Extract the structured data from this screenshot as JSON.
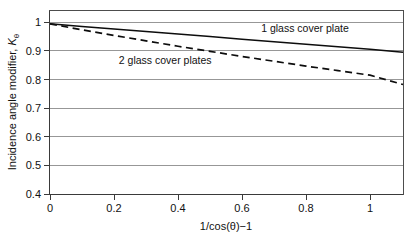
{
  "chart_data": {
    "type": "line",
    "title": "",
    "xlabel": "1/cos(θ)−1",
    "ylabel_prefix": "Incidence angle modifier, ",
    "ylabel_symbol": "K",
    "ylabel_subscript": "θ",
    "xlim": [
      0,
      1.103
    ],
    "ylim": [
      0.4,
      1.047
    ],
    "xticks": [
      0,
      0.2,
      0.4,
      0.6,
      0.8,
      1
    ],
    "xticklabels": [
      "0",
      "0.2",
      "0.4",
      "0.6",
      "0.8",
      "1"
    ],
    "yticks": [
      0.4,
      0.5,
      0.6,
      0.7,
      0.8,
      0.9,
      1
    ],
    "yticklabels": [
      "0.4",
      "0.5",
      "0.6",
      "0.7",
      "0.8",
      "0.9",
      "1"
    ],
    "grid": "horizontal",
    "legend_position": "inline-annotations",
    "series": [
      {
        "name": "1 glass cover plate",
        "style": "solid",
        "color": "#0d0d0d",
        "x": [
          0,
          0.1,
          0.2,
          0.3,
          0.4,
          0.5,
          0.6,
          0.7,
          0.8,
          0.9,
          1.0,
          1.103
        ],
        "values": [
          1.0,
          0.991,
          0.982,
          0.973,
          0.964,
          0.955,
          0.946,
          0.937,
          0.928,
          0.919,
          0.91,
          0.9
        ]
      },
      {
        "name": "2 glass cover plates",
        "style": "dashed",
        "color": "#0d0d0d",
        "x": [
          0,
          0.1,
          0.2,
          0.3,
          0.4,
          0.5,
          0.6,
          0.7,
          0.8,
          0.9,
          1.0,
          1.103
        ],
        "values": [
          1.0,
          0.979,
          0.959,
          0.94,
          0.921,
          0.903,
          0.885,
          0.868,
          0.851,
          0.835,
          0.819,
          0.786
        ]
      }
    ],
    "annotations": [
      {
        "text": "1 glass cover plate",
        "x": 0.66,
        "y": 0.972,
        "name": "annotation-1-glass-cover-plate"
      },
      {
        "text": "2 glass cover plates",
        "x": 0.215,
        "y": 0.857,
        "name": "annotation-2-glass-cover-plates"
      }
    ]
  }
}
